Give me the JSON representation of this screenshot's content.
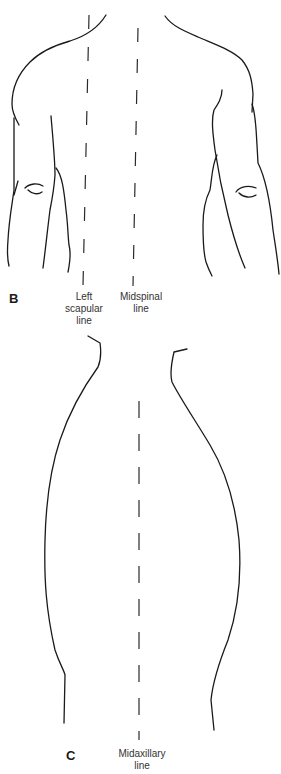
{
  "figure": {
    "panels": [
      {
        "id": "B",
        "label": "B",
        "view": "posterior thorax (back view)",
        "lines": [
          {
            "name": "left-scapular-line",
            "label": "Left\nscapular\nline"
          },
          {
            "name": "midspinal-line",
            "label": "Midspinal\nline"
          }
        ]
      },
      {
        "id": "C",
        "label": "C",
        "view": "lateral thorax (side view)",
        "lines": [
          {
            "name": "midaxillary-line",
            "label": "Midaxillary\nline"
          }
        ]
      }
    ]
  },
  "labels": {
    "panel_b": "B",
    "panel_c": "C",
    "left_scapular": "Left\nscapular\nline",
    "midspinal": "Midspinal\nline",
    "midaxillary": "Midaxillary\nline"
  },
  "colors": {
    "stroke": "#1a1a1a",
    "text": "#333333",
    "background": "#ffffff"
  }
}
